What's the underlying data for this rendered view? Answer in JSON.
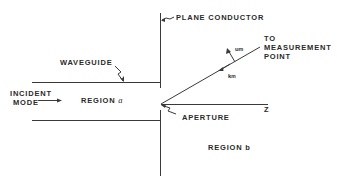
{
  "diagram": {
    "labels": {
      "plane_conductor": "PLANE CONDUCTOR",
      "waveguide": "WAVEGUIDE",
      "incident_mode_line1": "INCIDENT",
      "incident_mode_line2": "MODE",
      "region_a_prefix": "REGION",
      "region_a_var": "a",
      "region_b_prefix": "REGION",
      "region_b_var": "b",
      "aperture": "APERTURE",
      "z_axis": "Z",
      "to_measurement_line1": "TO",
      "to_measurement_line2": "MEASUREMENT",
      "to_measurement_line3": "POINT",
      "u_symbol": "u",
      "u_subscript": "m",
      "k_symbol": "k",
      "k_subscript": "m"
    },
    "colors": {
      "line": "#3a3a3a",
      "text": "#2a2a2a",
      "background": "#ffffff"
    }
  }
}
